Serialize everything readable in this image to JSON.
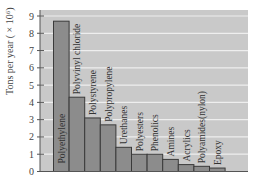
{
  "chart_data": {
    "type": "bar",
    "title": "",
    "xlabel": "",
    "ylabel": "Tons per year ( × 10⁶)",
    "ylim": [
      0,
      9
    ],
    "yticks": [
      0,
      1,
      2,
      3,
      4,
      5,
      6,
      7,
      8,
      9
    ],
    "grid": true,
    "legend": null,
    "categories": [
      "Polyethylene",
      "Polyvinyl chloride",
      "Polystyrene",
      "Polypropylene",
      "Urethanes",
      "Polyesters",
      "Phenolics",
      "Amines",
      "Acrylics",
      "Polyamides(nylon)",
      "Epoxy"
    ],
    "values": [
      8.7,
      4.3,
      3.1,
      2.7,
      1.4,
      1.0,
      1.0,
      0.7,
      0.4,
      0.3,
      0.2
    ]
  },
  "colors": {
    "plot_bg": "#c9c9c9",
    "bar_fill": "#8c8c8c",
    "bar_stroke": "#3a3a3a",
    "grid": "#eeeeee",
    "axis": "#555555"
  }
}
